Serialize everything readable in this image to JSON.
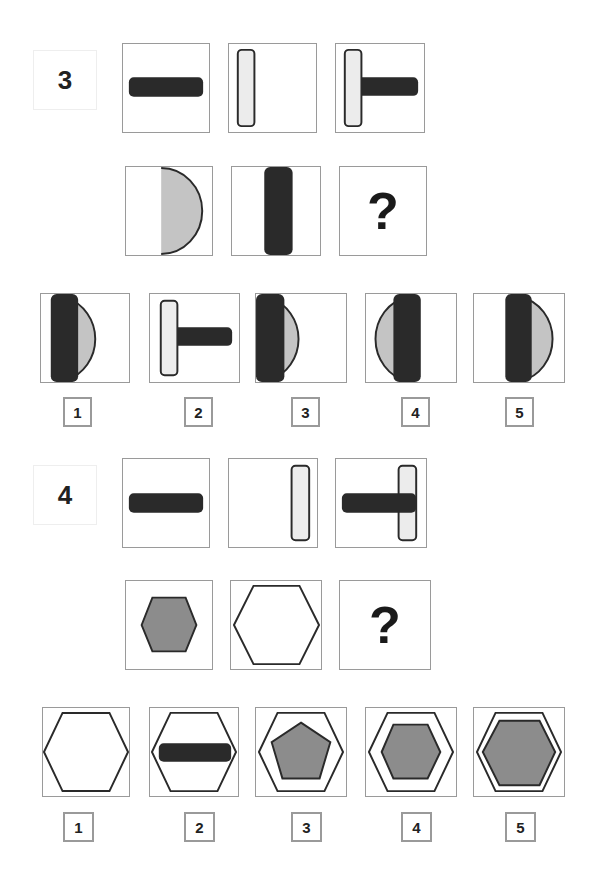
{
  "problems": [
    {
      "number": "3",
      "question_mark": "?",
      "row1": [
        "horizontal-dark-bar",
        "vertical-light-bar-left",
        "T-shape-light-bar-left-with-dark-bar"
      ],
      "row2": [
        "light-half-disc-right",
        "vertical-dark-bar-center",
        "unknown"
      ],
      "options": [
        {
          "label": "1",
          "figure": "dark-bar-left-over-half-disc"
        },
        {
          "label": "2",
          "figure": "light-bar-left-with-dark-bar-T"
        },
        {
          "label": "3",
          "figure": "dark-bar-at-edge-with-half-disc"
        },
        {
          "label": "4",
          "figure": "full-disc-left-half-with-dark-bar"
        },
        {
          "label": "5",
          "figure": "dark-bar-center-with-half-disc-right"
        }
      ]
    },
    {
      "number": "4",
      "question_mark": "?",
      "row1": [
        "horizontal-dark-bar",
        "vertical-light-bar-right",
        "dark-bar-over-light-bar-right"
      ],
      "row2": [
        "small-gray-hexagon",
        "large-outline-hexagon",
        "unknown"
      ],
      "options": [
        {
          "label": "1",
          "figure": "large-outline-hexagon"
        },
        {
          "label": "2",
          "figure": "large-hexagon-with-dark-bar"
        },
        {
          "label": "3",
          "figure": "large-hexagon-with-gray-pentagon"
        },
        {
          "label": "4",
          "figure": "large-hexagon-with-small-gray-hexagon"
        },
        {
          "label": "5",
          "figure": "large-hexagon-with-large-gray-hexagon"
        }
      ]
    }
  ],
  "colors": {
    "dark": "#2a2a2a",
    "light_fill": "#ececec",
    "gray_fill": "#8c8c8c",
    "half_disc_fill": "#c4c4c4",
    "tile_border": "#9a9a9a"
  }
}
